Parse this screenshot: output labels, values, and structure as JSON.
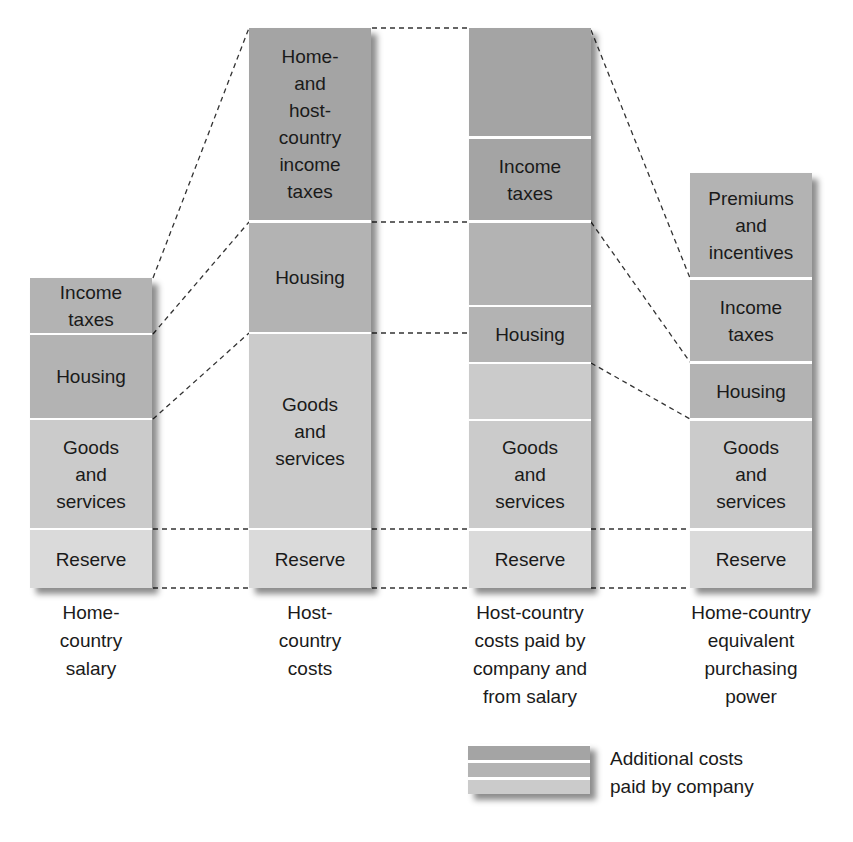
{
  "colors": {
    "additional_dark": "#a4a4a4",
    "additional_mid": "#b3b3b3",
    "goods": "#cbcbcb",
    "reserve": "#dadada",
    "connector_line": "#333333"
  },
  "columns": [
    {
      "id": "home-country-salary",
      "caption": [
        "Home-",
        "country",
        "salary"
      ],
      "segments": [
        {
          "label": "Income taxes",
          "lines": [
            "Income",
            "taxes"
          ]
        },
        {
          "label": "Housing",
          "lines": [
            "Housing"
          ]
        },
        {
          "label": "Goods and services",
          "lines": [
            "Goods",
            "and",
            "services"
          ]
        },
        {
          "label": "Reserve",
          "lines": [
            "Reserve"
          ]
        }
      ]
    },
    {
      "id": "host-country-costs",
      "caption": [
        "Host-",
        "country",
        "costs"
      ],
      "segments": [
        {
          "label": "Home- and host-country income taxes",
          "lines": [
            "Home-",
            "and",
            "host-",
            "country",
            "income",
            "taxes"
          ]
        },
        {
          "label": "Housing",
          "lines": [
            "Housing"
          ]
        },
        {
          "label": "Goods and services",
          "lines": [
            "Goods",
            "and",
            "services"
          ]
        },
        {
          "label": "Reserve",
          "lines": [
            "Reserve"
          ]
        }
      ]
    },
    {
      "id": "host-country-costs-paid",
      "caption": [
        "Host-country",
        "costs paid by",
        "company and",
        "from salary"
      ],
      "segments": [
        {
          "label": "",
          "lines": []
        },
        {
          "label": "Income taxes",
          "lines": [
            "Income",
            "taxes"
          ]
        },
        {
          "label": "",
          "lines": []
        },
        {
          "label": "Housing",
          "lines": [
            "Housing"
          ]
        },
        {
          "label": "",
          "lines": []
        },
        {
          "label": "Goods and services",
          "lines": [
            "Goods",
            "and",
            "services"
          ]
        },
        {
          "label": "Reserve",
          "lines": [
            "Reserve"
          ]
        }
      ]
    },
    {
      "id": "home-country-equivalent",
      "caption": [
        "Home-country",
        "equivalent",
        "purchasing",
        "power"
      ],
      "segments": [
        {
          "label": "Premiums and incentives",
          "lines": [
            "Premiums",
            "and",
            "incentives"
          ]
        },
        {
          "label": "Income taxes",
          "lines": [
            "Income",
            "taxes"
          ]
        },
        {
          "label": "Housing",
          "lines": [
            "Housing"
          ]
        },
        {
          "label": "Goods and services",
          "lines": [
            "Goods",
            "and",
            "services"
          ]
        },
        {
          "label": "Reserve",
          "lines": [
            "Reserve"
          ]
        }
      ]
    }
  ],
  "legend": {
    "lines": [
      "Additional costs",
      "paid by company"
    ]
  }
}
